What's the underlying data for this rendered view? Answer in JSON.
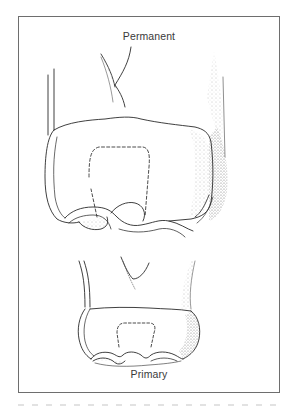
{
  "figure": {
    "labels": {
      "top": "Permanent",
      "bottom": "Primary"
    },
    "illustration": {
      "subject": "tooth-comparison-line-drawing",
      "elements": [
        "permanent-tooth",
        "primary-tooth"
      ],
      "stroke_color": "#2a2a2a",
      "stipple_color": "#8a8a8a",
      "frame_color": "#6e6e6e"
    }
  }
}
